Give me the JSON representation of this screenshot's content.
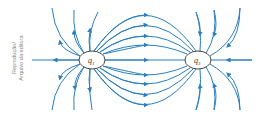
{
  "credit": {
    "line1": "Reprodução/",
    "line2": "Arquivo da editora"
  },
  "charges": [
    {
      "label": "q",
      "subscript": "1",
      "cx": 92,
      "cy": 60
    },
    {
      "label": "q",
      "subscript": "2",
      "cx": 198,
      "cy": 60
    }
  ],
  "colors": {
    "field_line": "#2a7fc0",
    "charge_outline": "#333333",
    "credit_text": "#8a8a8a"
  }
}
